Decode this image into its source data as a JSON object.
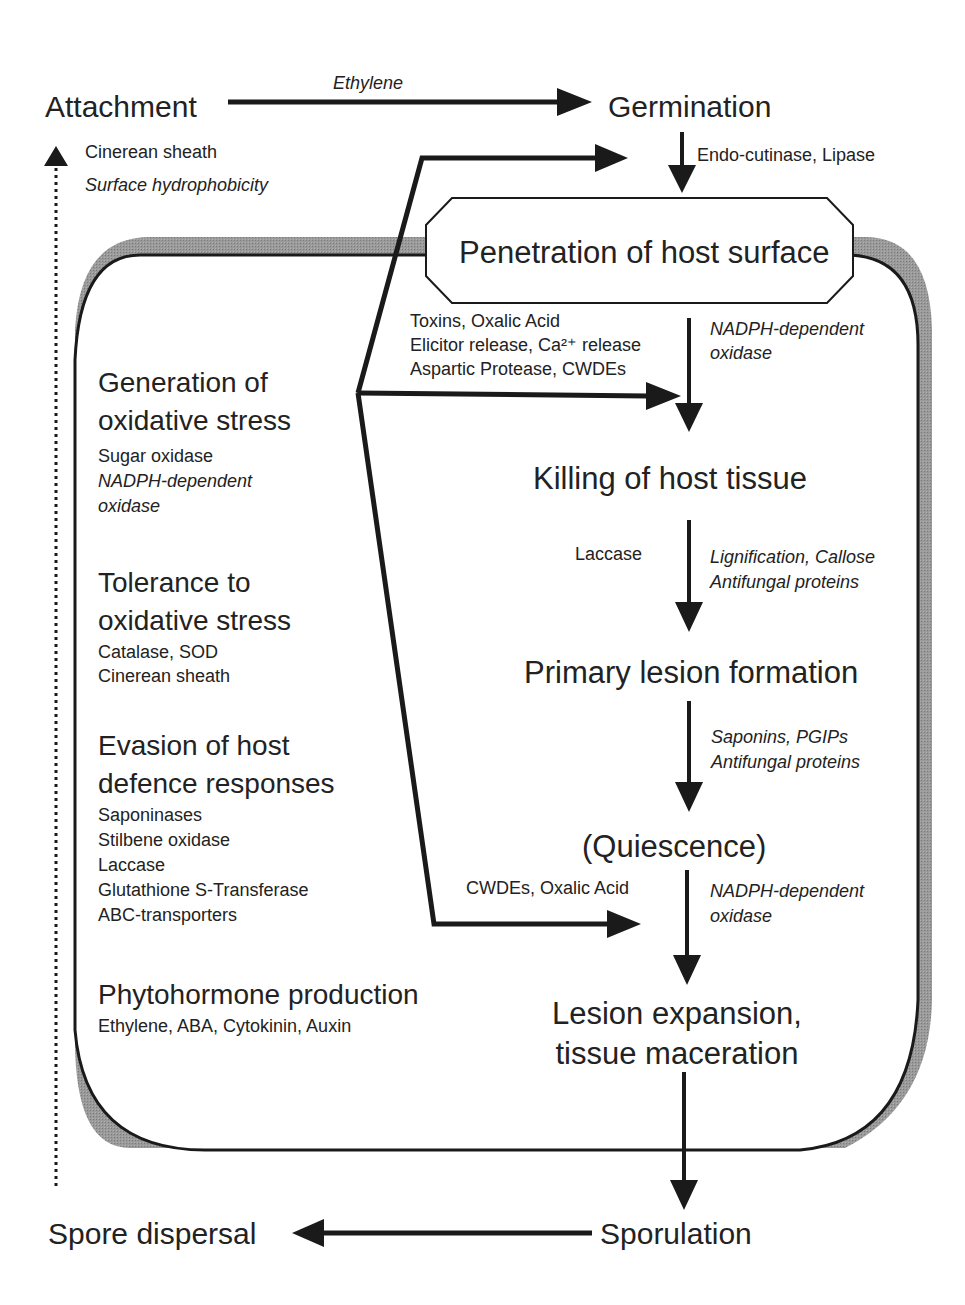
{
  "diagram": {
    "type": "pathogen infection cycle flow diagram",
    "colors": {
      "line": "#1a1a1a",
      "shadow": "#8c8c8c",
      "text": "#222222",
      "background": "#ffffff"
    },
    "outer_cycle": {
      "attachment": "Attachment",
      "germination": "Germination",
      "attachment_to_germination_label": "Ethylene",
      "attachment_factors": [
        "Cinerean sheath",
        "Surface hydrophobicity"
      ],
      "germination_to_penetration_label": "Endo-cutinase, Lipase",
      "sporulation": "Sporulation",
      "spore_dispersal": "Spore dispersal"
    },
    "stages": [
      {
        "id": "penetration",
        "label": "Penetration of host surface"
      },
      {
        "id": "killing",
        "label": "Killing of host tissue"
      },
      {
        "id": "primary_lesion",
        "label": "Primary lesion formation"
      },
      {
        "id": "quiescence",
        "label": "(Quiescence)"
      },
      {
        "id": "lesion_expansion",
        "label_lines": [
          "Lesion expansion,",
          "tissue maceration"
        ]
      }
    ],
    "transitions": {
      "penetration_to_killing": {
        "fungal": [
          "Toxins, Oxalic Acid",
          "Elicitor release, Ca²⁺ release",
          "Aspartic Protease, CWDEs"
        ],
        "host": [
          "NADPH-dependent",
          "oxidase"
        ]
      },
      "killing_to_primary": {
        "fungal": [
          "Laccase"
        ],
        "host": [
          "Lignification, Callose",
          "Antifungal proteins"
        ]
      },
      "primary_to_quiescence": {
        "host": [
          "Saponins, PGIPs",
          "Antifungal proteins"
        ]
      },
      "quiescence_to_expansion": {
        "fungal": [
          "CWDEs, Oxalic Acid"
        ],
        "host": [
          "NADPH-dependent",
          "oxidase"
        ]
      }
    },
    "mechanisms": [
      {
        "heading": [
          "Generation of",
          "oxidative stress"
        ],
        "items": [
          "Sugar oxidase"
        ],
        "italic_items": [
          "NADPH-dependent",
          "oxidase"
        ]
      },
      {
        "heading": [
          "Tolerance to",
          "oxidative stress"
        ],
        "items": [
          "Catalase, SOD",
          "Cinerean sheath"
        ]
      },
      {
        "heading": [
          "Evasion of host",
          "defence responses"
        ],
        "items": [
          "Saponinases",
          "Stilbene oxidase",
          "Laccase",
          "Glutathione S-Transferase",
          "ABC-transporters"
        ]
      },
      {
        "heading": [
          "Phytohormone production"
        ],
        "items": [
          "Ethylene, ABA, Cytokinin, Auxin"
        ]
      }
    ]
  }
}
